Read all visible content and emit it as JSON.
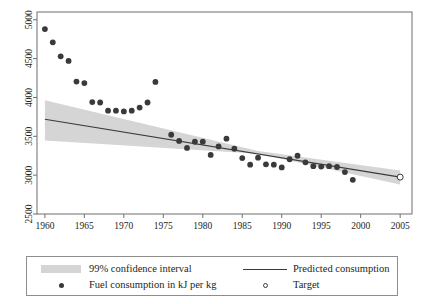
{
  "chart_data": {
    "type": "scatter",
    "title": "",
    "xlabel": "",
    "ylabel": "",
    "xlim": [
      1959,
      2006.5
    ],
    "ylim": [
      2500,
      5100
    ],
    "xticks": [
      1960,
      1965,
      1970,
      1975,
      1980,
      1985,
      1990,
      1995,
      2000,
      2005
    ],
    "yticks": [
      2500,
      3000,
      3500,
      4000,
      4500,
      5000
    ],
    "grid": false,
    "legend_position": "below-plot",
    "series": [
      {
        "name": "Fuel consumption in kJ per kg",
        "type": "scatter",
        "marker": "filled-circle",
        "color": "#3a3a3a",
        "points": [
          [
            1960,
            4880
          ],
          [
            1961,
            4710
          ],
          [
            1962,
            4530
          ],
          [
            1963,
            4470
          ],
          [
            1964,
            4205
          ],
          [
            1965,
            4185
          ],
          [
            1966,
            3940
          ],
          [
            1967,
            3935
          ],
          [
            1968,
            3830
          ],
          [
            1969,
            3830
          ],
          [
            1970,
            3820
          ],
          [
            1971,
            3830
          ],
          [
            1972,
            3870
          ],
          [
            1973,
            3935
          ],
          [
            1974,
            4200
          ],
          [
            1976,
            3520
          ],
          [
            1977,
            3440
          ],
          [
            1978,
            3350
          ],
          [
            1979,
            3430
          ],
          [
            1980,
            3430
          ],
          [
            1981,
            3260
          ],
          [
            1982,
            3370
          ],
          [
            1983,
            3470
          ],
          [
            1984,
            3340
          ],
          [
            1985,
            3220
          ],
          [
            1986,
            3135
          ],
          [
            1987,
            3225
          ],
          [
            1988,
            3140
          ],
          [
            1989,
            3135
          ],
          [
            1990,
            3100
          ],
          [
            1991,
            3205
          ],
          [
            1992,
            3250
          ],
          [
            1993,
            3165
          ],
          [
            1994,
            3115
          ],
          [
            1995,
            3110
          ],
          [
            1996,
            3115
          ],
          [
            1997,
            3105
          ],
          [
            1998,
            3040
          ],
          [
            1999,
            2940
          ]
        ]
      },
      {
        "name": "Predicted consumption",
        "type": "line",
        "color": "#3a3a3a",
        "points": [
          [
            1960,
            3720
          ],
          [
            2005,
            2975
          ]
        ]
      },
      {
        "name": "99% confidence interval",
        "type": "band",
        "color": "#d5d5d5",
        "upper": [
          [
            1960,
            3965
          ],
          [
            1987,
            3310
          ],
          [
            2005,
            3060
          ]
        ],
        "lower": [
          [
            1960,
            3445
          ],
          [
            1987,
            3275
          ],
          [
            2005,
            2880
          ]
        ]
      },
      {
        "name": "Target",
        "type": "scatter",
        "marker": "open-circle",
        "color": "#3a3a3a",
        "points": [
          [
            2005,
            2975
          ]
        ]
      }
    ]
  },
  "legend": {
    "items": [
      {
        "key": "confidence-band",
        "label": "99% confidence interval"
      },
      {
        "key": "predicted-line",
        "label": "Predicted consumption"
      },
      {
        "key": "observed-dot",
        "label": "Fuel consumption in kJ per kg"
      },
      {
        "key": "target-dot",
        "label": "Target"
      }
    ]
  },
  "axes": {
    "x_tick_labels": [
      "1960",
      "1965",
      "1970",
      "1975",
      "1980",
      "1985",
      "1990",
      "1995",
      "2000",
      "2005"
    ],
    "y_tick_labels": [
      "2500",
      "3000",
      "3500",
      "4000",
      "4500",
      "5000"
    ]
  },
  "colors": {
    "marker": "#3a3a3a",
    "line": "#3a3a3a",
    "band": "#d5d5d5",
    "axis": "#6f6f6f",
    "text": "#231f20"
  }
}
